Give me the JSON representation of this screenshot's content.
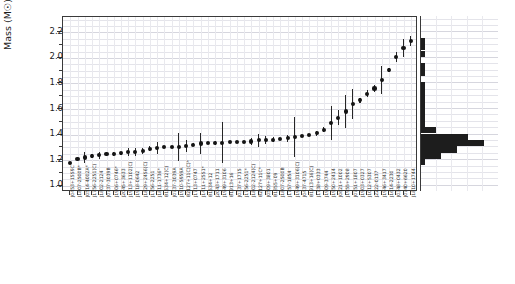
{
  "figure": {
    "name": "neutron-star-mass-measurements",
    "background": "#ffffff",
    "point_color": "#141414",
    "hist_color": "#1d1d1d",
    "grid_color": "#e9e9ee",
    "axis_color": "#3a3a3a"
  },
  "axes": {
    "ylabel": "Mass (M☉)",
    "yticks": [
      "1.0",
      "1.2",
      "1.4",
      "1.6",
      "1.8",
      "2.0",
      "2.2"
    ],
    "ylim": [
      0.95,
      2.32
    ],
    "xlabel": ""
  },
  "chart_data": {
    "type": "scatter",
    "title": "",
    "xlabel": "",
    "ylabel": "Mass (M☉)",
    "ylim": [
      0.95,
      2.32
    ],
    "grid": true,
    "legend": "none",
    "orientation": "sorted-ascending",
    "units": "solar masses",
    "categories": [
      "J0453+1559C",
      "J1807-2500B*",
      "J0514-4002A*",
      "J1756-2251(C)",
      "J1802-2124",
      "J0737-3039B",
      "J1906+0746*",
      "J2045+3633",
      "J1913+1102(C)",
      "J1918-0642",
      "J1829+2456(C)",
      "J1756-2251",
      "J1811-1736*",
      "B1534+12(C)",
      "J0737-3039A",
      "J1910-5959A",
      "B2127+11C(C)*",
      "J1713+0747",
      "J1411+2551*",
      "B1534+12",
      "J2043+1711",
      "J1949+3106",
      "B1913+16",
      "J0337+1715",
      "J1756-2251*",
      "J1802-2124(C)",
      "B2127+11C*",
      "J0509+3801",
      "B1855+09",
      "J1807-2500B",
      "J1757-1854",
      "J1949+3106(C)",
      "J0437-4715",
      "B1913+16(C)",
      "J1738+0333",
      "J1909-3744",
      "J1950+2414",
      "J0621+1002",
      "J1955+2908",
      "J0751+1807",
      "J1903+0327",
      "J1012+5307",
      "J2222-0137",
      "J1946+3417",
      "J1614-2230",
      "J0348+0432",
      "J0740+6620",
      "J1810+1744"
    ],
    "values": [
      1.174,
      1.206,
      1.22,
      1.23,
      1.238,
      1.249,
      1.248,
      1.252,
      1.262,
      1.265,
      1.27,
      1.288,
      1.295,
      1.3,
      1.3,
      1.302,
      1.31,
      1.32,
      1.33,
      1.333,
      1.335,
      1.335,
      1.34,
      1.34,
      1.341,
      1.345,
      1.354,
      1.358,
      1.36,
      1.365,
      1.37,
      1.38,
      1.39,
      1.395,
      1.41,
      1.438,
      1.49,
      1.53,
      1.58,
      1.64,
      1.667,
      1.72,
      1.76,
      1.83,
      1.908,
      2.01,
      2.08,
      2.13
    ],
    "errors_low": [
      0.004,
      0.01,
      0.04,
      0.017,
      0.028,
      0.002,
      0.018,
      0.015,
      0.03,
      0.032,
      0.022,
      0.02,
      0.045,
      0.004,
      0.001,
      0.11,
      0.05,
      0.011,
      0.08,
      0.004,
      0.018,
      0.16,
      0.001,
      0.002,
      0.007,
      0.03,
      0.05,
      0.03,
      0.02,
      0.01,
      0.03,
      0.16,
      0.002,
      0.001,
      0.02,
      0.02,
      0.13,
      0.06,
      0.13,
      0.12,
      0.02,
      0.03,
      0.03,
      0.11,
      0.016,
      0.04,
      0.07,
      0.04
    ],
    "errors_high": [
      0.004,
      0.01,
      0.04,
      0.017,
      0.028,
      0.002,
      0.018,
      0.015,
      0.03,
      0.032,
      0.022,
      0.02,
      0.045,
      0.004,
      0.001,
      0.11,
      0.05,
      0.011,
      0.08,
      0.004,
      0.018,
      0.16,
      0.001,
      0.002,
      0.007,
      0.03,
      0.05,
      0.03,
      0.02,
      0.01,
      0.03,
      0.16,
      0.002,
      0.001,
      0.02,
      0.02,
      0.13,
      0.06,
      0.13,
      0.12,
      0.02,
      0.03,
      0.03,
      0.11,
      0.016,
      0.04,
      0.07,
      0.04
    ]
  },
  "histogram": {
    "orientation": "horizontal",
    "bin_edges": [
      1.0,
      1.05,
      1.1,
      1.15,
      1.2,
      1.25,
      1.3,
      1.35,
      1.4,
      1.45,
      1.5,
      1.55,
      1.6,
      1.65,
      1.7,
      1.75,
      1.8,
      1.85,
      1.9,
      1.95,
      2.0,
      2.05,
      2.1,
      2.15
    ],
    "counts": [
      0,
      0,
      0,
      1,
      4,
      7,
      12,
      9,
      3,
      1,
      1,
      1,
      1,
      1,
      1,
      1,
      0,
      1,
      1,
      0,
      1,
      1,
      1,
      0
    ],
    "max_count": 12
  }
}
